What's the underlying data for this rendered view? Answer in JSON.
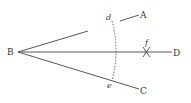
{
  "diagram": {
    "type": "geometric-construction",
    "points": {
      "B": {
        "label": "B",
        "x": 17,
        "y": 52
      },
      "A": {
        "label": "A",
        "x": 143,
        "y": 15
      },
      "D": {
        "label": "D",
        "x": 176,
        "y": 53
      },
      "C": {
        "label": "C",
        "x": 143,
        "y": 91
      },
      "d": {
        "label": "d",
        "x": 110,
        "y": 19
      },
      "e": {
        "label": "e",
        "x": 111,
        "y": 87
      },
      "f": {
        "label": "f",
        "x": 147,
        "y": 44
      }
    },
    "segments": [
      {
        "from": "B",
        "to": "A",
        "style": "solid"
      },
      {
        "from": "B",
        "to": "D",
        "style": "solid"
      },
      {
        "from": "B",
        "to": "C",
        "style": "solid"
      }
    ],
    "arcs": [
      {
        "name": "arc-de",
        "style": "dashed",
        "through": [
          "d",
          "e"
        ]
      }
    ],
    "marks": [
      {
        "name": "intersection-cross",
        "at": "f"
      }
    ],
    "colors": {
      "ink": "#444444",
      "background": "#ffffff"
    }
  }
}
